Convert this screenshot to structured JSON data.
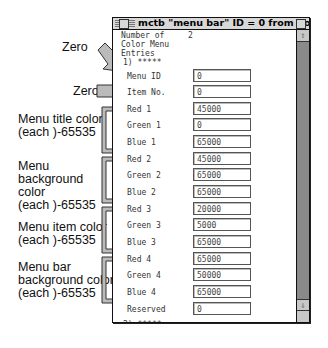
{
  "window": {
    "title": "mctb \"menu bar\" ID = 0 from Color"
  },
  "header": {
    "count_label": "Number of\nColor Menu\nEntries",
    "count_label_lines": [
      "Number of",
      "Color Menu",
      "Entries"
    ],
    "count_value": "2",
    "entry1_marker": "1) *****",
    "entry2_marker": "2) *****"
  },
  "fields": [
    {
      "label": "Menu ID",
      "value": "0"
    },
    {
      "label": "Item No.",
      "value": "0"
    },
    {
      "label": "Red 1",
      "value": "45000"
    },
    {
      "label": "Green 1",
      "value": "0"
    },
    {
      "label": "Blue 1",
      "value": "65000"
    },
    {
      "label": "Red 2",
      "value": "45000"
    },
    {
      "label": "Green 2",
      "value": "65000"
    },
    {
      "label": "Blue 2",
      "value": "65000"
    },
    {
      "label": "Red 3",
      "value": "20000"
    },
    {
      "label": "Green 3",
      "value": "5000"
    },
    {
      "label": "Blue 3",
      "value": "65000"
    },
    {
      "label": "Red 4",
      "value": "65000"
    },
    {
      "label": "Green 4",
      "value": "50000"
    },
    {
      "label": "Blue 4",
      "value": "65000"
    },
    {
      "label": "Reserved",
      "value": "0"
    }
  ],
  "annotations": {
    "zero1": "Zero",
    "zero2": "Zero",
    "menu_title": [
      "Menu title color",
      "(each )-65535"
    ],
    "menu_background": [
      "Menu",
      "background",
      "color",
      "(each )-65535"
    ],
    "menu_item": [
      "Menu item color",
      "(each )-65535"
    ],
    "menu_bar_background": [
      "Menu bar",
      "background color",
      "(each )-65535"
    ]
  },
  "scrollbar": {
    "up_icon": "⇧",
    "down_icon": "⇩"
  }
}
